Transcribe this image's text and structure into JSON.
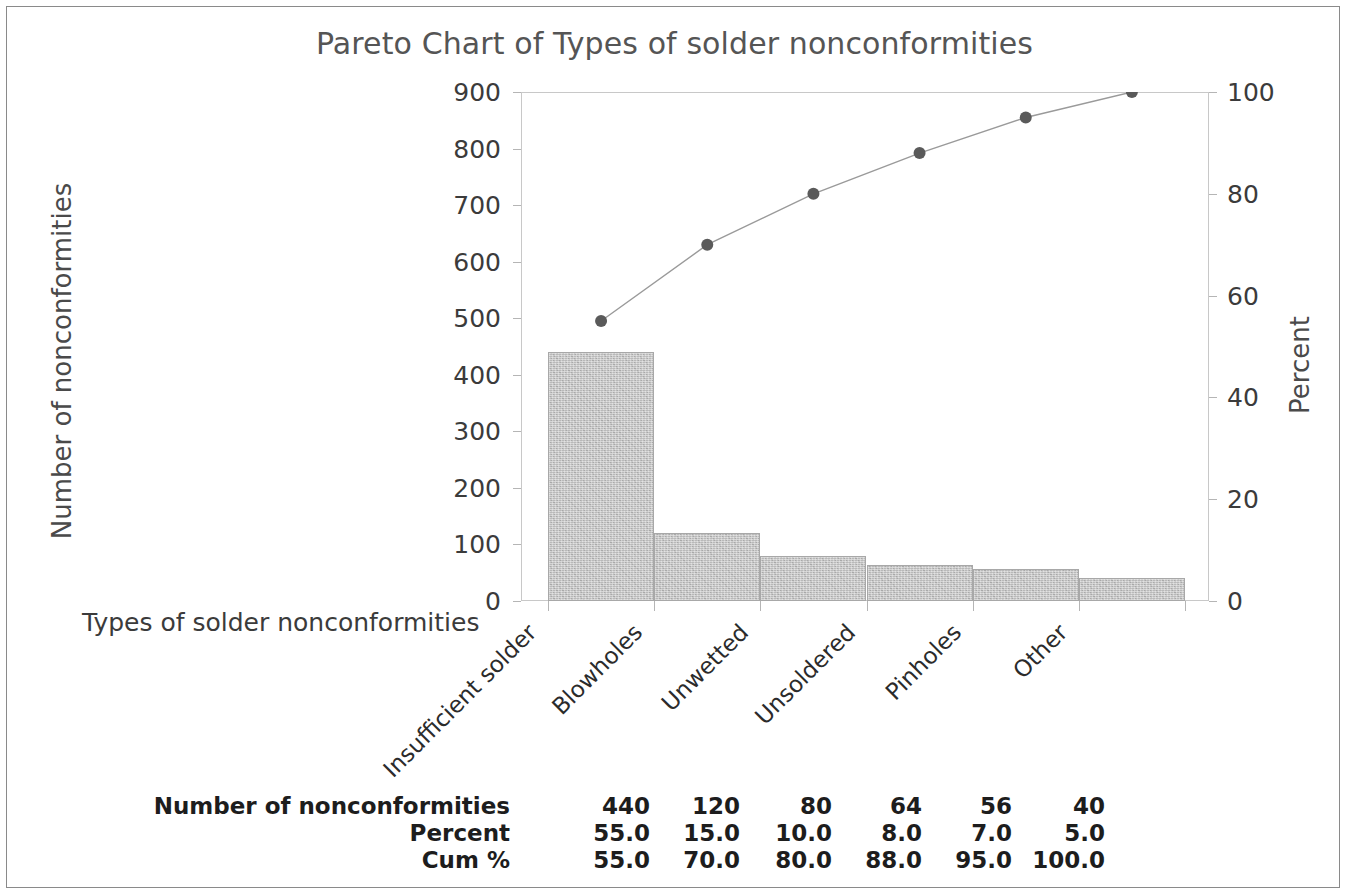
{
  "chart_data": {
    "type": "bar",
    "title": "Pareto Chart of Types of solder nonconformities",
    "xlabel": "Types of solder nonconformities",
    "ylabel": "Number of nonconformities",
    "ylabel_secondary": "Percent",
    "categories": [
      "Insufficient solder",
      "Blowholes",
      "Unwetted",
      "Unsoldered",
      "Pinholes",
      "Other"
    ],
    "values": [
      440,
      120,
      80,
      64,
      56,
      40
    ],
    "percent": [
      55.0,
      15.0,
      10.0,
      8.0,
      7.0,
      5.0
    ],
    "cum_percent": [
      55.0,
      70.0,
      80.0,
      88.0,
      95.0,
      100.0
    ],
    "ylim": [
      0,
      900
    ],
    "ylim_secondary": [
      0,
      100
    ],
    "yticks": [
      0,
      100,
      200,
      300,
      400,
      500,
      600,
      700,
      800,
      900
    ],
    "yticks_secondary": [
      0,
      20,
      40,
      60,
      80,
      100
    ],
    "ytick_labels": [
      "0",
      "100",
      "200",
      "300",
      "400",
      "500",
      "600",
      "700",
      "800",
      "900"
    ],
    "ytick_labels_secondary": [
      "0",
      "20",
      "40",
      "60",
      "80",
      "100"
    ],
    "grid": false,
    "legend": "none",
    "bar_color": "#b9b9b9",
    "line_color": "#9a9a9a",
    "marker_color": "#5a5a5a",
    "title_color": "#555555"
  },
  "table": {
    "rows": [
      {
        "label": "Number of nonconformities",
        "cells": [
          "440",
          "120",
          "80",
          "64",
          "56",
          "40"
        ]
      },
      {
        "label": "Percent",
        "cells": [
          "55.0",
          "15.0",
          "10.0",
          "8.0",
          "7.0",
          "5.0"
        ]
      },
      {
        "label": "Cum %",
        "cells": [
          "55.0",
          "70.0",
          "80.0",
          "88.0",
          "95.0",
          "100.0"
        ]
      }
    ]
  }
}
